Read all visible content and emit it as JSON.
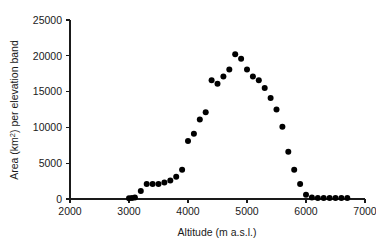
{
  "chart_data": {
    "type": "scatter",
    "title": "",
    "xlabel": "Altitude (m a.s.l.)",
    "ylabel_prefix": "Area (km",
    "ylabel_sup": "2",
    "ylabel_suffix": ") per elevation band",
    "ylabel": "Area (km2) per elevation band",
    "xlim": [
      2000,
      7000
    ],
    "ylim": [
      0,
      25000
    ],
    "xticks": [
      2000,
      3000,
      4000,
      5000,
      6000,
      7000
    ],
    "xtick_labels": [
      "2000",
      "3000",
      "4000",
      "5000",
      "6000",
      "7000"
    ],
    "yticks": [
      0,
      5000,
      10000,
      15000,
      20000,
      25000
    ],
    "ytick_labels": [
      "0",
      "5000",
      "10000",
      "15000",
      "20000",
      "25000"
    ],
    "grid": false,
    "legend": null,
    "marker": {
      "shape": "circle",
      "color": "#000000",
      "size_px": 3.0
    },
    "x": [
      3000,
      3050,
      3100,
      3200,
      3300,
      3400,
      3500,
      3600,
      3700,
      3800,
      3900,
      4000,
      4100,
      4200,
      4300,
      4400,
      4500,
      4600,
      4700,
      4800,
      4900,
      5000,
      5100,
      5200,
      5300,
      5400,
      5500,
      5600,
      5700,
      5800,
      5900,
      6000,
      6100,
      6200,
      6300,
      6400,
      6500,
      6600,
      6700
    ],
    "y": [
      100,
      150,
      200,
      1100,
      2100,
      2100,
      2100,
      2300,
      2600,
      3100,
      4100,
      8100,
      9100,
      11100,
      12100,
      16600,
      16100,
      17100,
      18100,
      20200,
      19600,
      18100,
      17100,
      16600,
      15500,
      14100,
      12500,
      10100,
      6600,
      4100,
      2100,
      600,
      200,
      150,
      150,
      150,
      150,
      150,
      150
    ],
    "points": [
      {
        "x": 3000,
        "y": 100
      },
      {
        "x": 3050,
        "y": 150
      },
      {
        "x": 3100,
        "y": 200
      },
      {
        "x": 3200,
        "y": 1100
      },
      {
        "x": 3300,
        "y": 2100
      },
      {
        "x": 3400,
        "y": 2100
      },
      {
        "x": 3500,
        "y": 2100
      },
      {
        "x": 3600,
        "y": 2300
      },
      {
        "x": 3700,
        "y": 2600
      },
      {
        "x": 3800,
        "y": 3100
      },
      {
        "x": 3900,
        "y": 4100
      },
      {
        "x": 4000,
        "y": 8100
      },
      {
        "x": 4100,
        "y": 9100
      },
      {
        "x": 4200,
        "y": 11100
      },
      {
        "x": 4300,
        "y": 12100
      },
      {
        "x": 4400,
        "y": 16600
      },
      {
        "x": 4500,
        "y": 16100
      },
      {
        "x": 4600,
        "y": 17100
      },
      {
        "x": 4700,
        "y": 18100
      },
      {
        "x": 4800,
        "y": 20200
      },
      {
        "x": 4900,
        "y": 19600
      },
      {
        "x": 5000,
        "y": 18100
      },
      {
        "x": 5100,
        "y": 17100
      },
      {
        "x": 5200,
        "y": 16600
      },
      {
        "x": 5300,
        "y": 15500
      },
      {
        "x": 5400,
        "y": 14100
      },
      {
        "x": 5500,
        "y": 12500
      },
      {
        "x": 5600,
        "y": 10100
      },
      {
        "x": 5700,
        "y": 6600
      },
      {
        "x": 5800,
        "y": 4100
      },
      {
        "x": 5900,
        "y": 2100
      },
      {
        "x": 6000,
        "y": 600
      },
      {
        "x": 6100,
        "y": 200
      },
      {
        "x": 6200,
        "y": 150
      },
      {
        "x": 6300,
        "y": 150
      },
      {
        "x": 6400,
        "y": 150
      },
      {
        "x": 6500,
        "y": 150
      },
      {
        "x": 6600,
        "y": 150
      },
      {
        "x": 6700,
        "y": 150
      }
    ]
  }
}
